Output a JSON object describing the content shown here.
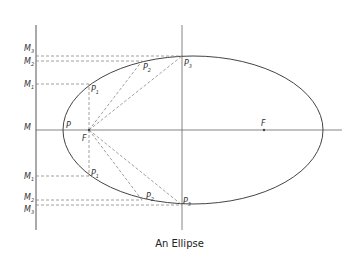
{
  "caption": "An Ellipse",
  "labels": {
    "M3_top": "M",
    "M2_top": "M",
    "M1_top": "M",
    "M": "M",
    "M1_bot": "M",
    "M2_bot": "M",
    "M3_bot": "M",
    "sub1": "1",
    "sub2": "2",
    "sub3": "3",
    "P": "P",
    "F_left": "F",
    "F_right": "F",
    "P1_top": "P",
    "P2_top": "P",
    "P3_top": "P",
    "P1_bot": "P",
    "P2_bot": "P",
    "P3_bot": "P"
  },
  "colors": {
    "line": "#555555",
    "dash": "#888888"
  }
}
